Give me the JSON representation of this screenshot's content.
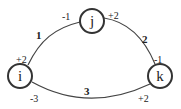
{
  "nodes": [
    {
      "id": "j",
      "label": "j"
    },
    {
      "id": "i",
      "label": "i"
    },
    {
      "id": "k",
      "label": "k"
    }
  ],
  "edges": [
    {
      "from": "i",
      "to": "j",
      "weight": "1",
      "from_end": "+2",
      "to_end": "-1"
    },
    {
      "from": "j",
      "to": "k",
      "weight": "2",
      "from_end": "+2",
      "to_end": "-1"
    },
    {
      "from": "i",
      "to": "k",
      "weight": "3",
      "from_end": "-3",
      "to_end": "+2"
    }
  ]
}
